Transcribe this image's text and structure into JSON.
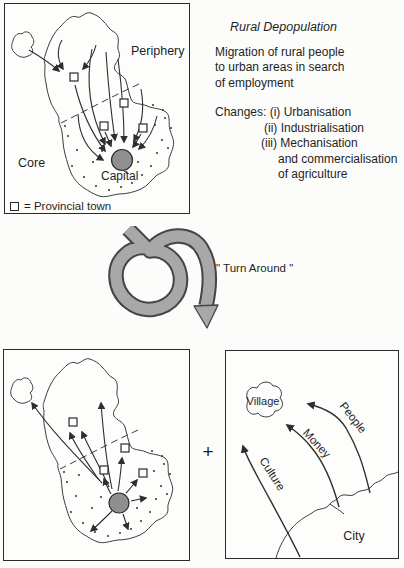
{
  "colors": {
    "ink": "#1f1f1f",
    "line": "#3c3c3c",
    "spiral_grey": "#a8a8a8",
    "capital_grey": "#8f8f8f",
    "paper": "#fcfcfb"
  },
  "top_left_panel": {
    "label_periphery": "Periphery",
    "label_core": "Core",
    "label_capital": "Capital",
    "legend_text": "= Provincial town"
  },
  "info": {
    "title": "Rural Depopulation",
    "description": "Migration of rural people\nto urban areas in search\nof employment",
    "changes": [
      "Changes: (i) Urbanisation",
      "(ii) Industrialisation",
      "(iii) Mechanisation",
      "and commercialisation",
      "of agriculture"
    ]
  },
  "turnaround": {
    "label": "\" Turn Around \""
  },
  "plus_sign": "+",
  "bottom_right_panel": {
    "label_village": "Village",
    "label_city": "City",
    "flow_labels": [
      "People",
      "Money",
      "Culture"
    ]
  }
}
